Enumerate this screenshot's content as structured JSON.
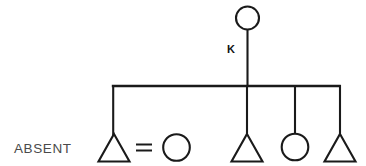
{
  "diagram": {
    "type": "pedigree-chart",
    "title": "",
    "background_color": "#ffffff",
    "line_color": "#1a1a1a",
    "labels": {
      "absent": "ABSENT",
      "proband_marker": "K"
    },
    "label_colors": {
      "absent": "#4a4a4a",
      "proband_marker": "#111111"
    },
    "generations": [
      {
        "name": "generation-1",
        "y": 18,
        "individuals": [
          {
            "id": "g1-mother",
            "symbol": "circle",
            "sex": "female",
            "cx": 247.5,
            "cy": 18,
            "r": 11.5,
            "affected": false,
            "label": ""
          }
        ]
      },
      {
        "name": "generation-2",
        "y": 148,
        "individuals": [
          {
            "id": "g2-child-1",
            "symbol": "triangle",
            "sex": "unknown",
            "cx": 114,
            "cy": 148,
            "size": 15,
            "affected": false,
            "label": "ABSENT",
            "connected_to_sibship": true
          },
          {
            "id": "g2-spouse-1",
            "symbol": "circle",
            "sex": "female",
            "cx": 176.5,
            "cy": 147,
            "r": 13.5,
            "affected": false,
            "label": "",
            "connected_to_sibship": false
          },
          {
            "id": "g2-child-2",
            "symbol": "triangle",
            "sex": "unknown",
            "cx": 247,
            "cy": 148,
            "size": 15,
            "affected": false,
            "label": "",
            "connected_to_sibship": true
          },
          {
            "id": "g2-child-3",
            "symbol": "circle",
            "sex": "female",
            "cx": 295,
            "cy": 147,
            "r": 13.5,
            "affected": false,
            "label": "",
            "connected_to_sibship": true
          },
          {
            "id": "g2-child-4",
            "symbol": "triangle",
            "sex": "unknown",
            "cx": 340,
            "cy": 148,
            "size": 15,
            "affected": false,
            "label": "",
            "connected_to_sibship": true
          }
        ]
      }
    ],
    "relationships": [
      {
        "id": "union-1",
        "type": "mating-line",
        "symbol": "=",
        "between": [
          "g2-child-1",
          "g2-spouse-1"
        ],
        "x1": 135,
        "x2": 155,
        "y": 147
      }
    ],
    "connectors": {
      "descent_line": {
        "x": 247.5,
        "y1": 29.5,
        "y2": 86
      },
      "sibship_line": {
        "x1": 112,
        "x2": 340.5,
        "y": 86
      },
      "drop_lines": [
        {
          "id": "drop-1",
          "x": 113.2,
          "y1": 86,
          "y2": 135
        },
        {
          "id": "drop-2",
          "x": 247,
          "y1": 86,
          "y2": 135
        },
        {
          "id": "drop-3",
          "x": 295,
          "y1": 86,
          "y2": 133.5
        },
        {
          "id": "drop-4",
          "x": 340,
          "y1": 86,
          "y2": 135
        }
      ]
    }
  }
}
